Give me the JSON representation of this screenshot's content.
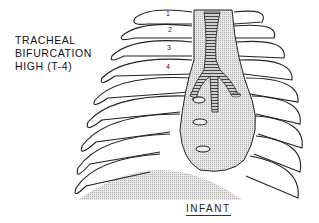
{
  "figure": {
    "side_label": [
      "TRACHEAL",
      "BIFURCATION",
      "HIGH (T-4)"
    ],
    "caption": "INFANT",
    "rib_numbers": [
      "1",
      "2",
      "3",
      "4"
    ],
    "colors": {
      "line": "#222222",
      "shade": "#d6d6d6",
      "trachea": "#9a9a9a"
    }
  }
}
